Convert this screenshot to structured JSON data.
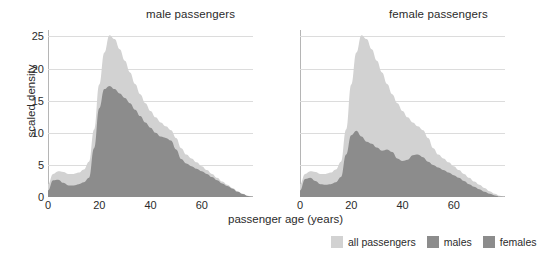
{
  "chart_data": {
    "type": "area",
    "title": "",
    "xlabel": "passenger age (years)",
    "ylabel": "scaled density",
    "xlim": [
      0,
      80
    ],
    "ylim": [
      0,
      26
    ],
    "xticks": [
      0,
      20,
      40,
      60
    ],
    "yticks": [
      0,
      5,
      10,
      15,
      20,
      25
    ],
    "grid": true,
    "legend_position": "bottom-right",
    "panels": [
      {
        "title": "male passengers",
        "series": [
          {
            "name": "all passengers",
            "color": "#d2d2d2",
            "x": [
              0,
              2,
              4,
              6,
              8,
              10,
              12,
              14,
              16,
              18,
              20,
              22,
              24,
              26,
              28,
              30,
              32,
              34,
              36,
              38,
              40,
              42,
              44,
              46,
              48,
              50,
              52,
              54,
              56,
              58,
              60,
              62,
              64,
              66,
              68,
              70,
              72,
              74,
              76,
              78,
              80
            ],
            "values": [
              2.0,
              3.6,
              4.0,
              3.9,
              3.6,
              3.6,
              3.8,
              4.3,
              5.5,
              10.5,
              17.5,
              22.5,
              25.2,
              24.6,
              23.0,
              21.2,
              19.4,
              17.6,
              16.0,
              14.6,
              13.4,
              12.4,
              11.6,
              11.0,
              10.4,
              9.2,
              7.6,
              6.6,
              6.0,
              5.4,
              4.8,
              4.2,
              3.6,
              3.0,
              2.4,
              1.9,
              1.4,
              0.9,
              0.5,
              0.2,
              0.0
            ]
          },
          {
            "name": "males",
            "color": "#8c8c8c",
            "x": [
              0,
              2,
              4,
              6,
              8,
              10,
              12,
              14,
              16,
              18,
              20,
              22,
              24,
              26,
              28,
              30,
              32,
              34,
              36,
              38,
              40,
              42,
              44,
              46,
              48,
              50,
              52,
              54,
              56,
              58,
              60,
              62,
              64,
              66,
              68,
              70,
              72,
              74,
              76,
              78,
              80
            ],
            "values": [
              1.0,
              2.6,
              2.7,
              2.2,
              1.8,
              1.8,
              2.0,
              2.3,
              3.0,
              7.6,
              13.8,
              16.8,
              17.3,
              16.8,
              16.1,
              15.4,
              14.6,
              13.6,
              12.6,
              11.6,
              10.8,
              10.0,
              9.4,
              9.2,
              8.8,
              7.4,
              5.9,
              5.2,
              4.8,
              4.4,
              4.0,
              3.6,
              3.1,
              2.6,
              2.1,
              1.7,
              1.3,
              0.8,
              0.45,
              0.15,
              0.0
            ]
          }
        ]
      },
      {
        "title": "female passengers",
        "series": [
          {
            "name": "all passengers",
            "color": "#d2d2d2",
            "x": [
              0,
              2,
              4,
              6,
              8,
              10,
              12,
              14,
              16,
              18,
              20,
              22,
              24,
              26,
              28,
              30,
              32,
              34,
              36,
              38,
              40,
              42,
              44,
              46,
              48,
              50,
              52,
              54,
              56,
              58,
              60,
              62,
              64,
              66,
              68,
              70,
              72,
              74,
              76,
              78,
              80
            ],
            "values": [
              2.0,
              3.6,
              4.0,
              3.9,
              3.6,
              3.6,
              3.8,
              4.3,
              5.5,
              10.5,
              17.5,
              22.5,
              25.2,
              24.6,
              23.0,
              21.2,
              19.4,
              17.6,
              16.0,
              14.6,
              13.4,
              12.4,
              11.6,
              11.0,
              10.4,
              9.2,
              7.6,
              6.6,
              6.0,
              5.4,
              4.8,
              4.2,
              3.6,
              3.0,
              2.4,
              1.9,
              1.4,
              0.9,
              0.5,
              0.2,
              0.0
            ]
          },
          {
            "name": "females",
            "color": "#8c8c8c",
            "x": [
              0,
              2,
              4,
              6,
              8,
              10,
              12,
              14,
              16,
              18,
              20,
              22,
              24,
              26,
              28,
              30,
              32,
              34,
              36,
              38,
              40,
              42,
              44,
              46,
              48,
              50,
              52,
              54,
              56,
              58,
              60,
              62,
              64,
              66,
              68,
              70,
              72,
              74,
              76,
              78,
              80
            ],
            "values": [
              1.0,
              2.8,
              3.0,
              2.5,
              2.0,
              1.9,
              2.0,
              2.3,
              3.1,
              6.6,
              9.6,
              10.3,
              9.4,
              8.6,
              8.3,
              7.7,
              7.2,
              7.4,
              7.0,
              6.0,
              5.6,
              5.8,
              6.5,
              6.6,
              6.2,
              5.5,
              5.0,
              4.6,
              4.2,
              3.8,
              3.4,
              3.0,
              2.5,
              2.0,
              1.6,
              1.2,
              0.8,
              0.5,
              0.25,
              0.08,
              0.0
            ]
          }
        ]
      }
    ],
    "legend": [
      {
        "label": "all passengers",
        "color": "#d2d2d2"
      },
      {
        "label": "males",
        "color": "#8c8c8c"
      },
      {
        "label": "females",
        "color": "#8c8c8c"
      }
    ]
  },
  "axis": {
    "ylabel": "scaled density",
    "xlabel": "passenger age (years)"
  }
}
